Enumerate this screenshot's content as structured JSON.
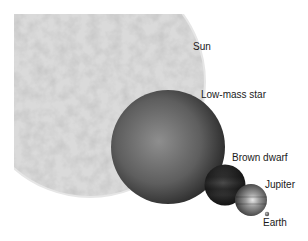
{
  "diagram": {
    "color_scheme": "grayscale",
    "bodies": [
      {
        "id": "sun",
        "label": "Sun",
        "cx": 90,
        "cy": 82,
        "r": 115,
        "fill": "#d4d4d4"
      },
      {
        "id": "low-mass-star",
        "label": "Low-mass star",
        "cx": 168,
        "cy": 147,
        "r": 57,
        "fill": "#6a6a6a"
      },
      {
        "id": "brown-dwarf",
        "label": "Brown dwarf",
        "cx": 225,
        "cy": 185,
        "r": 20,
        "fill": "#3a3a3a"
      },
      {
        "id": "jupiter",
        "label": "Jupiter",
        "cx": 251,
        "cy": 200,
        "r": 16,
        "fill": "#8a8a8a"
      },
      {
        "id": "earth",
        "label": "Earth",
        "cx": 267,
        "cy": 214,
        "r": 2,
        "fill": "#777777"
      }
    ]
  }
}
